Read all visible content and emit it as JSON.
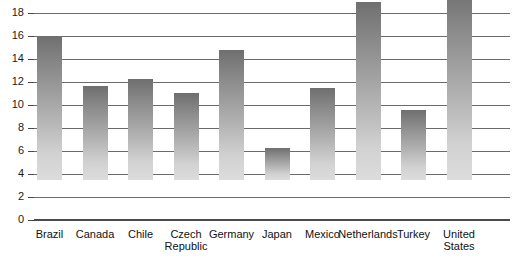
{
  "chart_data": {
    "type": "bar",
    "title": "",
    "subtitle": "",
    "xlabel": "",
    "ylabel": "",
    "ylim": [
      0,
      18
    ],
    "yticks": [
      0,
      2,
      4,
      6,
      8,
      10,
      12,
      14,
      16,
      18
    ],
    "ytick_labels": [
      "0",
      "2",
      "4",
      "6",
      "8",
      "10",
      "12",
      "14",
      "16",
      "18"
    ],
    "grid": true,
    "legend": false,
    "legend_position": "none",
    "bar_color_top": "#6f6f6f",
    "bar_color_bottom": "#dcdcdc",
    "axis_color": "#4a4a4a",
    "gridline_color": "#6b6b6b",
    "categories": [
      "Brazil",
      "Canada",
      "Chile",
      "Czech\nRepublic",
      "Germany",
      "Japan",
      "Mexico",
      "Netherlands",
      "Turkey",
      "United\nStates"
    ],
    "values": [
      12.5,
      8.2,
      8.8,
      7.6,
      11.3,
      2.8,
      8.0,
      15.5,
      6.1,
      16.7
    ]
  }
}
